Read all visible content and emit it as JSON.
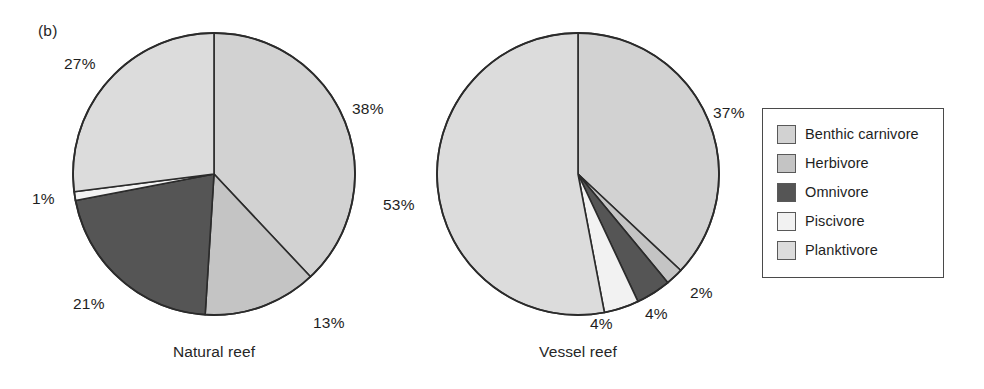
{
  "figure": {
    "panel_label": "(b)",
    "background": "#ffffff",
    "outline_color": "#2b2b2b"
  },
  "legend": {
    "name": "feeding-guild-legend",
    "border_color": "#4a4a4a",
    "items": [
      {
        "label": "Benthic carnivore",
        "color": "#d2d2d2"
      },
      {
        "label": "Herbivore",
        "color": "#c4c4c4"
      },
      {
        "label": "Omnivore",
        "color": "#555555"
      },
      {
        "label": "Piscivore",
        "color": "#f2f2f2"
      },
      {
        "label": "Planktivore",
        "color": "#dcdcdc"
      }
    ]
  },
  "chart_data": {
    "type": "pie",
    "title": "(b)",
    "legend_position": "right",
    "categories": [
      "Benthic carnivore",
      "Herbivore",
      "Omnivore",
      "Piscivore",
      "Planktivore"
    ],
    "colors": [
      "#d2d2d2",
      "#c4c4c4",
      "#555555",
      "#f2f2f2",
      "#dcdcdc"
    ],
    "charts": [
      {
        "name": "natural-reef",
        "caption": "Natural reef",
        "center": [
          214,
          174
        ],
        "radius": 141,
        "start_angle_deg": 0,
        "direction": "clockwise",
        "slices": [
          {
            "category": "Benthic carnivore",
            "value": 38,
            "label": "38%",
            "label_x": 352,
            "label_y": 100
          },
          {
            "category": "Herbivore",
            "value": 13,
            "label": "13%",
            "label_x": 313,
            "label_y": 314
          },
          {
            "category": "Omnivore",
            "value": 21,
            "label": "21%",
            "label_x": 73,
            "label_y": 295
          },
          {
            "category": "Piscivore",
            "value": 1,
            "label": "1%",
            "label_x": 32,
            "label_y": 190
          },
          {
            "category": "Planktivore",
            "value": 27,
            "label": "27%",
            "label_x": 64,
            "label_y": 55
          }
        ]
      },
      {
        "name": "vessel-reef",
        "caption": "Vessel reef",
        "center": [
          578,
          174
        ],
        "radius": 141,
        "start_angle_deg": 0,
        "direction": "clockwise",
        "slices": [
          {
            "category": "Benthic carnivore",
            "value": 37,
            "label": "37%",
            "label_x": 713,
            "label_y": 104
          },
          {
            "category": "Herbivore",
            "value": 2,
            "label": "2%",
            "label_x": 690,
            "label_y": 284
          },
          {
            "category": "Omnivore",
            "value": 4,
            "label": "4%",
            "label_x": 645,
            "label_y": 305
          },
          {
            "category": "Piscivore",
            "value": 4,
            "label": "4%",
            "label_x": 590,
            "label_y": 315
          },
          {
            "category": "Planktivore",
            "value": 53,
            "label": "53%",
            "label_x": 383,
            "label_y": 196
          }
        ]
      }
    ]
  }
}
